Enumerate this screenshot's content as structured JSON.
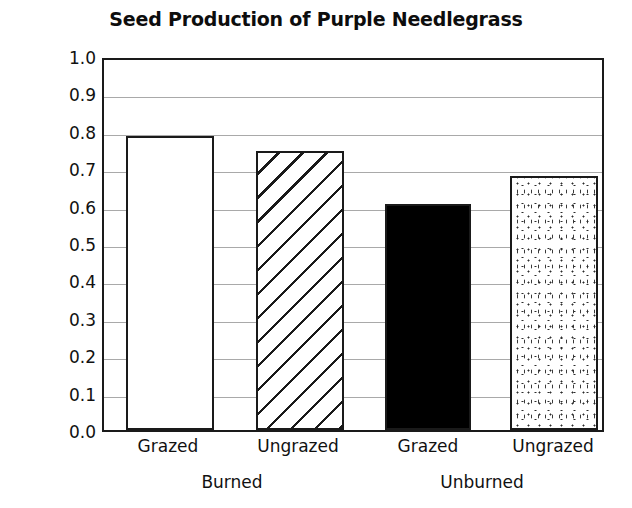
{
  "chart_data": {
    "type": "bar",
    "title": "Seed Production of Purple Needlegrass",
    "xlabel": "",
    "ylabel": "Seed mass (mg)",
    "ylim": [
      0.0,
      1.0
    ],
    "ytick_labels": [
      "1.0",
      "0.9",
      "0.8",
      "0.7",
      "0.6",
      "0.5",
      "0.4",
      "0.3",
      "0.2",
      "0.1",
      "0.0"
    ],
    "ytick_values": [
      1.0,
      0.9,
      0.8,
      0.7,
      0.6,
      0.5,
      0.4,
      0.3,
      0.2,
      0.1,
      0.0
    ],
    "grid": true,
    "grid_axis": "y",
    "grid_color": "#a9a9a9",
    "legend": "none",
    "categories": [
      "Grazed",
      "Ungrazed",
      "Grazed",
      "Ungrazed"
    ],
    "groups": [
      "Burned",
      "Unburned"
    ],
    "values": [
      0.785,
      0.745,
      0.605,
      0.68
    ],
    "bars": [
      {
        "label": "Grazed",
        "group": "Burned",
        "value": 0.785,
        "fill": "open"
      },
      {
        "label": "Ungrazed",
        "group": "Burned",
        "value": 0.745,
        "fill": "hatch"
      },
      {
        "label": "Grazed",
        "group": "Unburned",
        "value": 0.605,
        "fill": "solid"
      },
      {
        "label": "Ungrazed",
        "group": "Unburned",
        "value": 0.68,
        "fill": "dots"
      }
    ],
    "colors": {
      "axis": "#1a1a1a",
      "grid": "#a9a9a9",
      "bar_outline": "#1a1a1a",
      "bar_solid": "#000000",
      "background": "#ffffff"
    }
  }
}
